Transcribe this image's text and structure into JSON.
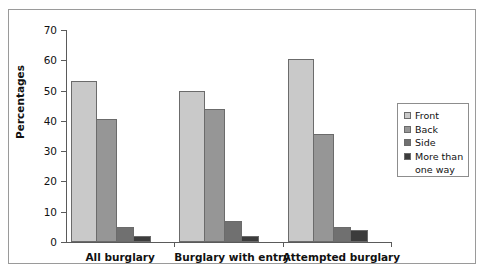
{
  "chart_data": {
    "type": "bar",
    "title": "",
    "xlabel": "",
    "ylabel": "Percentages",
    "ylim": [
      0,
      70
    ],
    "yticks": [
      "0",
      "10",
      "20",
      "30",
      "40",
      "50",
      "60",
      "70"
    ],
    "grid": false,
    "legend_position": "right",
    "categories": [
      "All burglary",
      "Burglary with entry",
      "Attempted burglary"
    ],
    "series": [
      {
        "name": "Front",
        "color": "#c9c9c9",
        "values": [
          53,
          50,
          60.5
        ]
      },
      {
        "name": "Back",
        "color": "#969696",
        "values": [
          40.5,
          44,
          35.5
        ]
      },
      {
        "name": "Side",
        "color": "#707070",
        "values": [
          5,
          7,
          5
        ]
      },
      {
        "name": "More than one way",
        "color": "#3c3c3c",
        "values": [
          2,
          2,
          4
        ]
      }
    ]
  },
  "legend": {
    "items": [
      {
        "label": "Front"
      },
      {
        "label": "Back"
      },
      {
        "label": "Side"
      },
      {
        "label": "More than"
      },
      {
        "label": "one way"
      }
    ]
  }
}
